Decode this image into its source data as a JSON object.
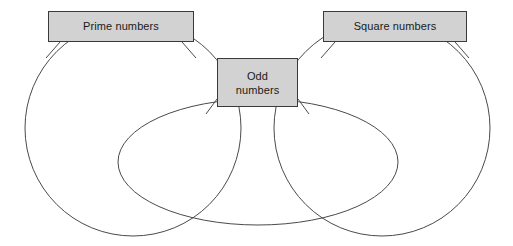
{
  "diagram": {
    "type": "venn-diagram",
    "title": "",
    "background_color": "#ffffff",
    "stroke_color": "#4a4a4a",
    "label_fill_color": "#d2d2d2",
    "label_border_color": "#3a3a3a",
    "label_text_color": "#1a1a1a",
    "sets": [
      {
        "id": "prime",
        "label": "Prime numbers",
        "shape": "circle",
        "cx": 133,
        "cy": 128,
        "r": 108
      },
      {
        "id": "odd",
        "label": "Odd\nnumbers",
        "label_line_1": "Odd",
        "label_line_2": "numbers",
        "shape": "ellipse",
        "cx": 258,
        "cy": 162,
        "rx": 140,
        "ry": 63
      },
      {
        "id": "square",
        "label": "Square numbers",
        "shape": "circle",
        "cx": 382,
        "cy": 128,
        "r": 108
      }
    ],
    "leaders": [
      {
        "id": "prime-left",
        "x1": 60,
        "y1": 42,
        "x2": 46,
        "y2": 57
      },
      {
        "id": "prime-right",
        "x1": 182,
        "y1": 42,
        "x2": 196,
        "y2": 58
      },
      {
        "id": "square-left",
        "x1": 335,
        "y1": 42,
        "x2": 321,
        "y2": 58
      },
      {
        "id": "square-right",
        "x1": 455,
        "y1": 42,
        "x2": 469,
        "y2": 58
      },
      {
        "id": "odd-left",
        "x1": 217,
        "y1": 98,
        "x2": 205,
        "y2": 114
      },
      {
        "id": "odd-right",
        "x1": 298,
        "y1": 98,
        "x2": 310,
        "y2": 114
      }
    ]
  }
}
